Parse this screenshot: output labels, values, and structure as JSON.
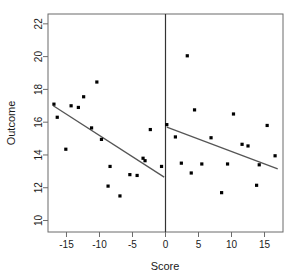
{
  "chart_data": {
    "type": "scatter",
    "title": "",
    "xlabel": "Score",
    "ylabel": "Outcome",
    "xlim": [
      -17.8,
      17.8
    ],
    "ylim": [
      9.3,
      22.6
    ],
    "xticks": [
      -15,
      -10,
      -5,
      0,
      5,
      10,
      15
    ],
    "yticks": [
      10,
      12,
      14,
      16,
      18,
      20,
      22
    ],
    "grid": false,
    "legend": "none",
    "point_color": "#000000",
    "line_color": "#555555",
    "cutoff_line_color": "#333333",
    "cutoff": 0,
    "annotations": [
      {
        "name": "cutoff-line",
        "x": 0,
        "note": "vertical threshold line at Score = 0"
      }
    ],
    "series": [
      {
        "name": "Left of cutoff",
        "points": [
          [
            -16.9,
            17.1
          ],
          [
            -16.4,
            16.3
          ],
          [
            -15.1,
            14.35
          ],
          [
            -14.3,
            17.0
          ],
          [
            -13.2,
            16.9
          ],
          [
            -12.4,
            17.55
          ],
          [
            -11.2,
            15.65
          ],
          [
            -10.4,
            18.45
          ],
          [
            -9.7,
            14.95
          ],
          [
            -8.7,
            12.1
          ],
          [
            -8.4,
            13.3
          ],
          [
            -6.9,
            11.5
          ],
          [
            -5.4,
            12.8
          ],
          [
            -4.3,
            12.75
          ],
          [
            -3.4,
            13.8
          ],
          [
            -3.1,
            13.65
          ],
          [
            -2.3,
            15.55
          ],
          [
            -0.6,
            13.3
          ]
        ]
      },
      {
        "name": "Right of cutoff",
        "points": [
          [
            0.2,
            15.85
          ],
          [
            1.5,
            15.1
          ],
          [
            2.4,
            13.5
          ],
          [
            3.3,
            20.05
          ],
          [
            3.9,
            12.9
          ],
          [
            4.4,
            16.75
          ],
          [
            5.5,
            13.45
          ],
          [
            6.9,
            15.05
          ],
          [
            8.5,
            11.7
          ],
          [
            9.4,
            13.45
          ],
          [
            10.3,
            16.5
          ],
          [
            11.6,
            14.65
          ],
          [
            12.5,
            14.55
          ],
          [
            13.8,
            12.15
          ],
          [
            14.2,
            13.4
          ],
          [
            15.4,
            15.8
          ],
          [
            16.6,
            13.95
          ]
        ]
      }
    ],
    "fits": [
      {
        "name": "left-fit-line",
        "x0": -17.0,
        "y0": 17.0,
        "x1": -0.2,
        "y1": 12.65
      },
      {
        "name": "right-fit-line",
        "x0": 0.2,
        "y0": 15.7,
        "x1": 17.0,
        "y1": 13.15
      }
    ]
  }
}
